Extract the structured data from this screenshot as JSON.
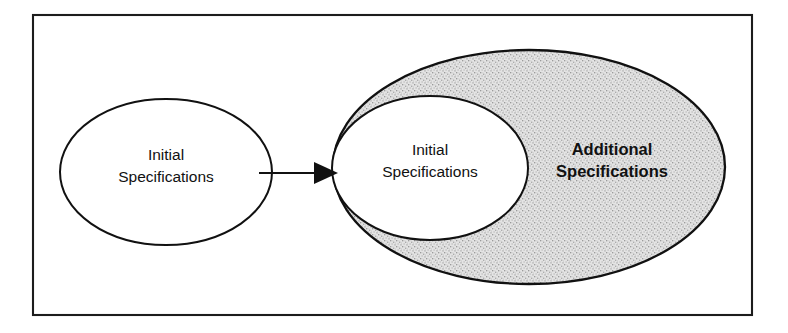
{
  "diagram": {
    "type": "venn-set-expansion",
    "background_color": "#ffffff",
    "frame": {
      "name": "outer-frame",
      "stroke_color": "#1c1c1c",
      "fill_color": "#ffffff",
      "x": 33,
      "y": 15,
      "width": 719,
      "height": 300
    },
    "nodes": [
      {
        "id": "left-initial",
        "shape": "ellipse",
        "label_line1": "Initial",
        "label_line2": "Specifications",
        "emphasis": "regular",
        "fill_color": "#ffffff",
        "stroke_color": "#111111",
        "cx": 166,
        "cy": 172,
        "rx": 106,
        "ry": 73
      },
      {
        "id": "outer-additional",
        "shape": "ellipse",
        "label_line1": "Additional",
        "label_line2": "Specifications",
        "emphasis": "bold",
        "fill_color": "#dcdcdc",
        "stroke_color": "#111111",
        "cx": 529,
        "cy": 167,
        "rx": 196,
        "ry": 117,
        "label_cx": 612,
        "label_cy": 162
      },
      {
        "id": "inner-initial",
        "shape": "ellipse",
        "label_line1": "Initial",
        "label_line2": "Specifications",
        "emphasis": "regular",
        "fill_color": "#ffffff",
        "stroke_color": "#111111",
        "cx": 430,
        "cy": 168,
        "rx": 98,
        "ry": 72
      }
    ],
    "connector": {
      "id": "transition-arrow",
      "from": "left-initial",
      "to": "inner-initial",
      "stroke_color": "#111111",
      "x1": 259,
      "y1": 173,
      "x2": 322,
      "y2": 173,
      "head_tip_x": 338,
      "head_back_x": 314,
      "head_half_height": 11
    }
  }
}
